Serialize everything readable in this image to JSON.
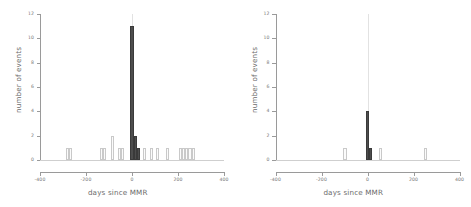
{
  "figure": {
    "panel_count": 2,
    "background": "#ffffff",
    "bar_color_light": "#fbfbfb",
    "bar_color_light_border": "#c9c9c9",
    "bar_color_dark": "#4d4d4d",
    "axis_color": "#9a9a9a",
    "reference_line_color": "#e2e2e2"
  },
  "chart_data": [
    {
      "type": "bar",
      "id": "left-panel",
      "title": "",
      "xlabel": "days since MMR",
      "ylabel": "number of events",
      "xlim": [
        -400,
        400
      ],
      "ylim": [
        0,
        12
      ],
      "xticks": [
        -400,
        -200,
        0,
        200,
        400
      ],
      "xticklabels": [
        "-400",
        "-200",
        "0",
        "200",
        "400"
      ],
      "yticks": [
        0,
        2,
        4,
        6,
        8,
        10,
        12
      ],
      "yticklabels": [
        "0",
        "2",
        "4",
        "6",
        "8",
        "10",
        "12"
      ],
      "grid": false,
      "legend": "none",
      "bin_width": 14,
      "reference_line_x": 0,
      "annotations": [
        "vertical reference line at day 0"
      ],
      "bars": [
        {
          "x": -280,
          "value": 1,
          "highlight": false
        },
        {
          "x": -266,
          "value": 1,
          "highlight": false
        },
        {
          "x": -133,
          "value": 1,
          "highlight": false
        },
        {
          "x": -119,
          "value": 1,
          "highlight": false
        },
        {
          "x": -84,
          "value": 2,
          "highlight": false
        },
        {
          "x": -56,
          "value": 1,
          "highlight": false
        },
        {
          "x": -42,
          "value": 1,
          "highlight": false
        },
        {
          "x": 0,
          "value": 11,
          "highlight": true
        },
        {
          "x": 14,
          "value": 2,
          "highlight": true
        },
        {
          "x": 28,
          "value": 1,
          "highlight": true
        },
        {
          "x": 56,
          "value": 1,
          "highlight": false
        },
        {
          "x": 84,
          "value": 1,
          "highlight": false
        },
        {
          "x": 112,
          "value": 1,
          "highlight": false
        },
        {
          "x": 154,
          "value": 1,
          "highlight": false
        },
        {
          "x": 210,
          "value": 1,
          "highlight": false
        },
        {
          "x": 224,
          "value": 1,
          "highlight": false
        },
        {
          "x": 238,
          "value": 1,
          "highlight": false
        },
        {
          "x": 252,
          "value": 1,
          "highlight": false
        },
        {
          "x": 266,
          "value": 1,
          "highlight": false
        }
      ]
    },
    {
      "type": "bar",
      "id": "right-panel",
      "title": "",
      "xlabel": "days since MMR",
      "ylabel": "number of events",
      "xlim": [
        -400,
        400
      ],
      "ylim": [
        0,
        12
      ],
      "xticks": [
        -400,
        -200,
        0,
        200,
        400
      ],
      "xticklabels": [
        "-400",
        "-200",
        "0",
        "200",
        "400"
      ],
      "yticks": [
        0,
        2,
        4,
        6,
        8,
        10,
        12
      ],
      "yticklabels": [
        "0",
        "2",
        "4",
        "6",
        "8",
        "10",
        "12"
      ],
      "grid": false,
      "legend": "none",
      "bin_width": 14,
      "reference_line_x": 0,
      "annotations": [
        "vertical reference line at day 0"
      ],
      "bars": [
        {
          "x": -98,
          "value": 1,
          "highlight": false
        },
        {
          "x": 0,
          "value": 4,
          "highlight": true
        },
        {
          "x": 14,
          "value": 1,
          "highlight": true
        },
        {
          "x": 56,
          "value": 1,
          "highlight": false
        },
        {
          "x": 252,
          "value": 1,
          "highlight": false
        }
      ]
    }
  ]
}
